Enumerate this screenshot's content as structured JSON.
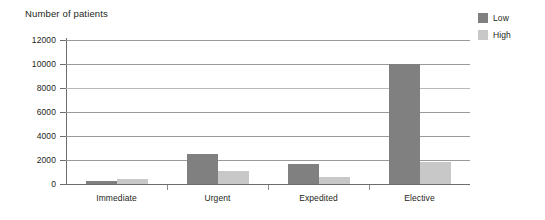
{
  "chart_data": {
    "type": "bar",
    "title": "Number of patients",
    "xlabel": "",
    "ylabel": "",
    "ylim": [
      0,
      12000
    ],
    "yticks": [
      0,
      2000,
      4000,
      6000,
      8000,
      10000,
      12000
    ],
    "ytick_labels": [
      "0",
      "2000",
      "4000",
      "6000",
      "8000",
      "10000",
      "12000"
    ],
    "grid": true,
    "legend_position": "top-right",
    "categories": [
      "Immediate",
      "Urgent",
      "Expedited",
      "Elective"
    ],
    "series": [
      {
        "name": "Low",
        "color": "#808080",
        "values": [
          250,
          2500,
          1700,
          10000
        ]
      },
      {
        "name": "High",
        "color": "#c8c8c8",
        "values": [
          400,
          1100,
          550,
          1800
        ]
      }
    ]
  },
  "legend": {
    "items": [
      {
        "label": "Low",
        "color": "#808080"
      },
      {
        "label": "High",
        "color": "#c8c8c8"
      }
    ]
  }
}
